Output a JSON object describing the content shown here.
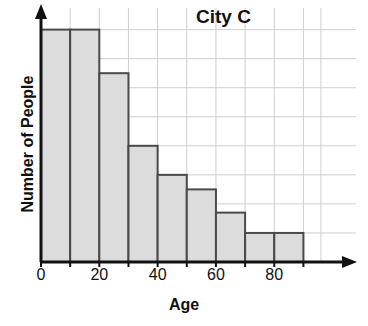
{
  "chart_data": {
    "type": "bar",
    "title": "City C",
    "xlabel": "Age",
    "ylabel": "Number of People",
    "categories": [
      "0-10",
      "10-20",
      "20-30",
      "30-40",
      "40-50",
      "50-60",
      "60-70",
      "70-80",
      "80-90"
    ],
    "bin_edges": [
      0,
      10,
      20,
      30,
      40,
      50,
      60,
      70,
      80,
      90
    ],
    "values": [
      8,
      8,
      6.5,
      4,
      3,
      2.5,
      1.7,
      1,
      1
    ],
    "xlim": [
      0,
      95
    ],
    "ylim": [
      0,
      8.4
    ],
    "xtick_labels": [
      "0",
      "20",
      "40",
      "60",
      "80"
    ],
    "xtick_values": [
      0,
      20,
      40,
      60,
      80
    ],
    "ytick_labels": [],
    "grid": true,
    "legend": null,
    "bar_fill_color": "#dcdcdc",
    "bar_edge_color": "#4a4a4a",
    "grid_color": "#c9c9c9",
    "axis_color": "#111111",
    "background_color": "#ffffff",
    "axis_arrows": true
  }
}
